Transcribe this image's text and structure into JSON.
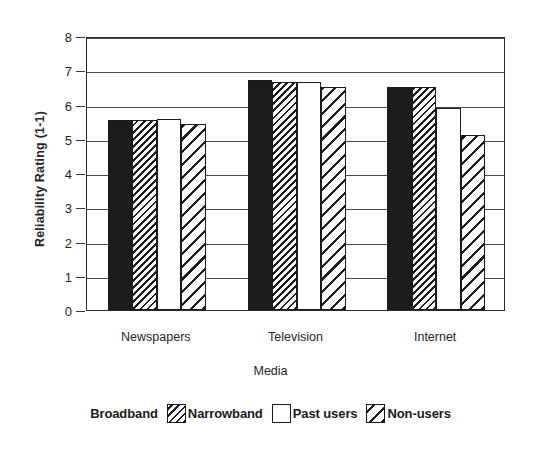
{
  "chart_data": {
    "type": "bar",
    "title": "",
    "subtitle": "",
    "xlabel": "Media",
    "ylabel": "Reliability Rating (1-1)",
    "categories": [
      "Newspapers",
      "Television",
      "Internet"
    ],
    "ylim": [
      0,
      8
    ],
    "yticks": [
      0,
      1,
      2,
      3,
      4,
      5,
      6,
      7,
      8
    ],
    "ytick_labels": [
      "0",
      "1",
      "2",
      "3",
      "4",
      "5",
      "6",
      "7",
      "8"
    ],
    "grid": "horizontal",
    "legend_position": "bottom",
    "series": [
      {
        "name": "Broadband",
        "pattern": "solid-black",
        "color": "#1c1c1c",
        "values": [
          5.55,
          6.72,
          6.5
        ]
      },
      {
        "name": "Narrowband",
        "pattern": "diagonal-hatch-dense",
        "color": "#1c1c1c",
        "values": [
          5.55,
          6.65,
          6.5
        ]
      },
      {
        "name": "Past users",
        "pattern": "empty-white",
        "color": "#ffffff",
        "values": [
          5.58,
          6.65,
          5.9
        ]
      },
      {
        "name": "Non-users",
        "pattern": "diagonal-hatch-wide",
        "color": "#1c1c1c",
        "values": [
          5.43,
          6.52,
          5.12
        ]
      }
    ]
  },
  "legend": {
    "entries": [
      {
        "label": "Broadband",
        "swatch": "solid-black-swatch"
      },
      {
        "label": "Narrowband",
        "swatch": "dense-hatch-swatch"
      },
      {
        "label": "Past users",
        "swatch": "empty-white-swatch"
      },
      {
        "label": "Non-users",
        "swatch": "wide-hatch-swatch"
      }
    ]
  },
  "colors": {
    "axis": "#2b2b2b",
    "grid": "#4a4a4a",
    "ink": "#1c1c1c",
    "background": "#ffffff"
  }
}
